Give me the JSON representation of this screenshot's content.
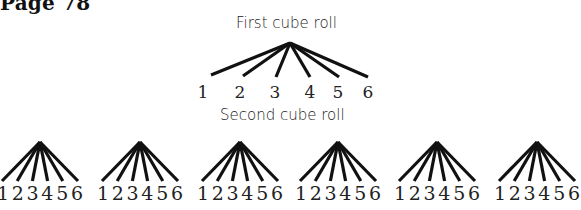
{
  "page": {
    "label": "Page 78"
  },
  "diagram": {
    "first_roll": {
      "title": "First cube roll",
      "outcomes": [
        "1",
        "2",
        "3",
        "4",
        "5",
        "6"
      ]
    },
    "second_roll": {
      "title": "Second cube roll",
      "branch_count": 6,
      "outcomes": [
        "1",
        "2",
        "3",
        "4",
        "5",
        "6"
      ]
    },
    "colors": {
      "line": "#111111",
      "text": "#222222",
      "background": "#ffffff"
    }
  }
}
